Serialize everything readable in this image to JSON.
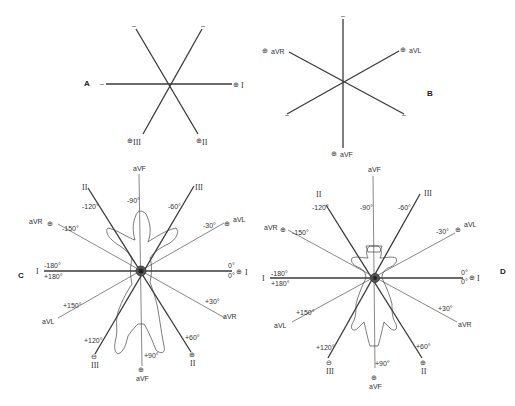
{
  "figure": {
    "panels": [
      {
        "id": "A",
        "label": "A",
        "description": "Bipolar limb lead axes",
        "leads": [
          {
            "name": "I",
            "positive_label": "⊕",
            "lead_label": "I",
            "negative_label": "–"
          },
          {
            "name": "II",
            "positive_label": "⊕",
            "lead_label": "II",
            "negative_label": "–"
          },
          {
            "name": "III",
            "positive_label": "⊕",
            "lead_label": "III",
            "negative_label": "–"
          }
        ]
      },
      {
        "id": "B",
        "label": "B",
        "description": "Augmented unipolar limb lead axes",
        "leads": [
          {
            "name": "aVR",
            "positive_label": "⊕",
            "lead_label": "aVR",
            "negative_label": "–"
          },
          {
            "name": "aVL",
            "positive_label": "⊕",
            "lead_label": "aVL",
            "negative_label": "–"
          },
          {
            "name": "aVF",
            "positive_label": "⊕",
            "lead_label": "aVF",
            "negative_label": "–"
          }
        ]
      },
      {
        "id": "C",
        "label": "C",
        "description": "Hexaxial reference system superimposed on dog (dorsal recumbency)",
        "axis_labels": {
          "top_aVF": "aVF",
          "top_II": "II",
          "top_III": "III",
          "minus90": "-90°",
          "minus120": "-120°",
          "minus60": "-60°",
          "aVR_pos": "aVR",
          "minus150": "-150°",
          "minus30": "-30°",
          "aVL_pos": "aVL",
          "left_I": "I",
          "minus180": "-180°",
          "plus180": "+180°",
          "zero_top": "0°",
          "zero_bottom": "0°",
          "right_I": "I",
          "plus150": "+150°",
          "aVL_neg": "aVL",
          "plus30": "+30°",
          "aVR_neg": "aVR",
          "plus120": "+120°",
          "plus60": "+60°",
          "III_bottom": "III",
          "II_bottom": "II",
          "plus90": "+90°",
          "aVF_bottom": "aVF",
          "plus_symbol": "⊕",
          "minus_symbol": "⊖"
        }
      },
      {
        "id": "D",
        "label": "D",
        "description": "Hexaxial reference system superimposed on dog (alternate view)",
        "axis_labels": {
          "top_aVF": "aVF",
          "top_II": "II",
          "top_III": "III",
          "minus90": "-90°",
          "minus120": "-120°",
          "minus60": "-60°",
          "aVR_pos": "aVR",
          "minus150": "-150°",
          "minus30": "-30°",
          "aVL_pos": "aVL",
          "left_I": "I",
          "minus180": "-180°",
          "plus180": "+180°",
          "zero_top": "0°",
          "zero_bottom": "0°",
          "right_I": "I",
          "plus150": "+150°",
          "aVL_neg": "aVL",
          "plus30": "+30°",
          "aVR_neg": "aVR",
          "plus120": "+120°",
          "plus60": "+60°",
          "III_bottom": "III",
          "II_bottom": "II",
          "plus90": "+90°",
          "aVF_bottom": "aVF",
          "plus_symbol": "⊕",
          "minus_symbol": "⊖"
        }
      }
    ],
    "colors": {
      "line": "#3a3a3a",
      "background": "#ffffff"
    }
  }
}
